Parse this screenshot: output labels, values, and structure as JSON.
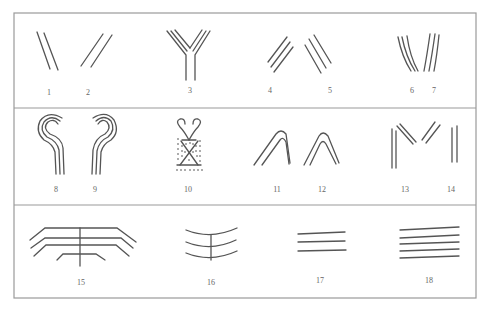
{
  "figure": {
    "rows": [
      {
        "labels": [
          "1",
          "2",
          "3",
          "4",
          "5",
          "6",
          "7"
        ]
      },
      {
        "labels": [
          "8",
          "9",
          "10",
          "11",
          "12",
          "13",
          "14"
        ]
      },
      {
        "labels": [
          "15",
          "16",
          "17",
          "18"
        ]
      }
    ]
  },
  "colors": {
    "frame": "#9a9a9a",
    "stroke": "#555555",
    "label": "#666666"
  }
}
